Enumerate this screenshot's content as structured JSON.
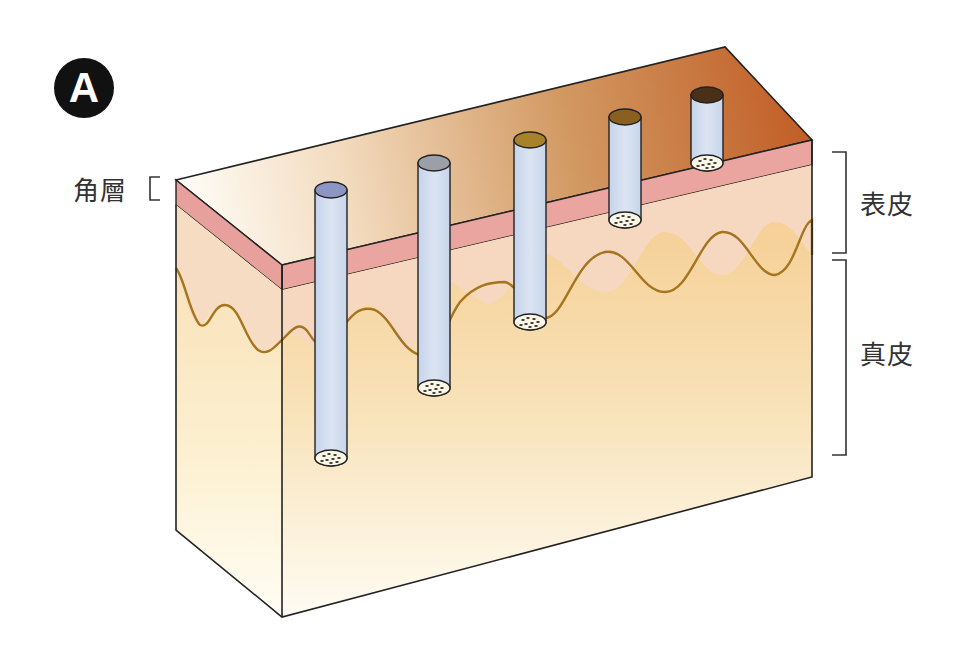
{
  "figure": {
    "panel_label": "A",
    "labels": {
      "stratum_corneum": "角層",
      "epidermis": "表皮",
      "dermis": "真皮"
    },
    "colors": {
      "stratum_corneum": "#e8a3a0",
      "epidermis": "#f5d8bf",
      "dermis": "#f6cf8a",
      "junction_line": "#a5741e",
      "top_surface_light": "#fdfbf5",
      "top_surface_dark": "#c0632a",
      "follicle_tube": "#c9d6ea",
      "outline": "#222222"
    },
    "follicles": [
      {
        "name": "follicle-1",
        "cap_color": "#8c95c4",
        "depth": "dermis-deep"
      },
      {
        "name": "follicle-2",
        "cap_color": "#9a9fa8",
        "depth": "dermis-deep"
      },
      {
        "name": "follicle-3",
        "cap_color": "#a8822a",
        "depth": "dermis-upper"
      },
      {
        "name": "follicle-4",
        "cap_color": "#8a6020",
        "depth": "epidermis"
      },
      {
        "name": "follicle-5",
        "cap_color": "#4a3018",
        "depth": "stratum-corneum"
      }
    ]
  }
}
